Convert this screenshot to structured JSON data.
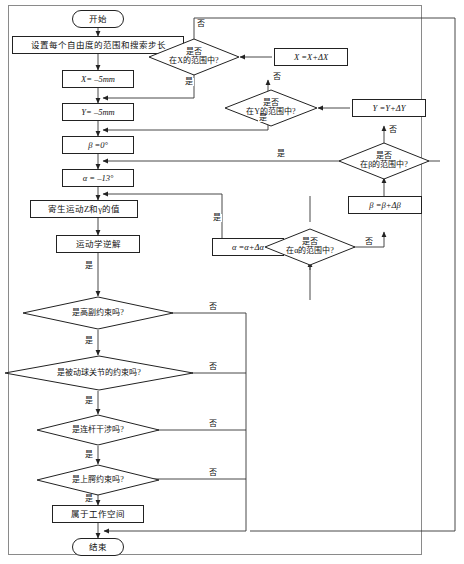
{
  "diagram": {
    "type": "flowchart",
    "language": "zh-CN",
    "colors": {
      "background": "#ffffff",
      "stroke": "#222222",
      "frame": "#8a8a8a",
      "text": "#111111"
    },
    "nodes": {
      "start": "开始",
      "set_ranges": "设置每个自由度的范围和搜索步长",
      "init_x": "X= –5mm",
      "init_y": "Y= –5mm",
      "init_beta": "β =0°",
      "init_alpha": "α = –13°",
      "parasitic": "寄生运动Z和γ的值",
      "inverse_kin": "运动学逆解",
      "in_workspace": "属于工作空间",
      "end": "结束",
      "incr_x": "X =X+ΔX",
      "incr_y": "Y =Y+ΔY",
      "incr_beta": "β =β+Δβ",
      "incr_alpha": "α =α+Δα"
    },
    "decisions": {
      "range_x": {
        "line1": "是否",
        "line2": "在X的范围中?"
      },
      "range_y": {
        "line1": "是否",
        "line2": "在Y的范围中?"
      },
      "range_beta": {
        "line1": "是否",
        "line2": "在β的范围中?"
      },
      "range_alpha": {
        "line1": "是否",
        "line2": "在α的范围中?"
      },
      "high_pair": {
        "line1": "是高副约束吗?"
      },
      "ball_joint": {
        "line1": "是被动球关节的约束吗?"
      },
      "link_interfere": {
        "line1": "是连杆干涉吗?"
      },
      "maxilla": {
        "line1": "是上腭约束吗?"
      }
    },
    "edge_labels": {
      "yes": "是",
      "no": "否"
    }
  }
}
